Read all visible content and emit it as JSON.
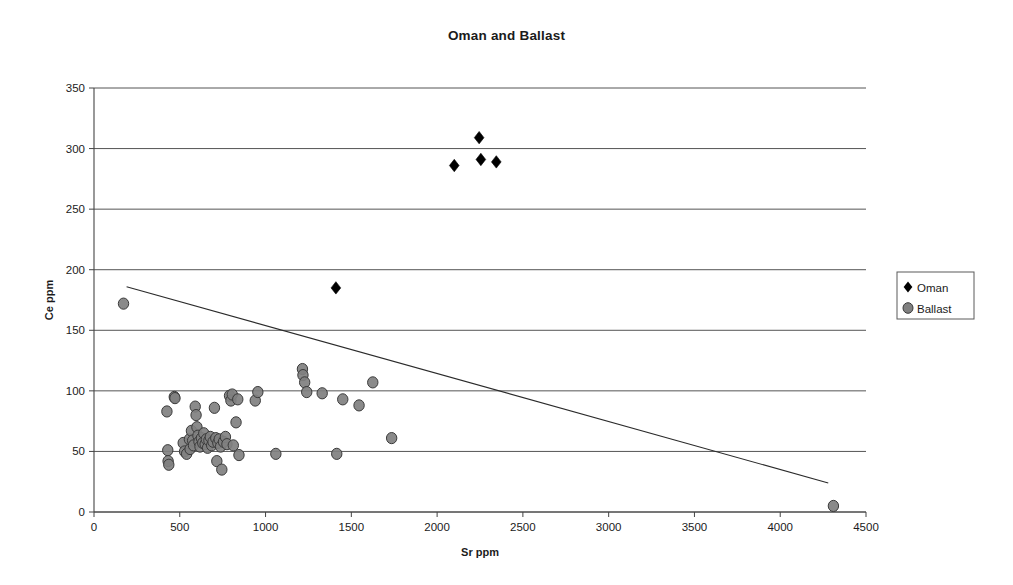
{
  "chart_data": {
    "type": "scatter",
    "title": "Oman and Ballast",
    "xlabel": "Sr ppm",
    "ylabel": "Ce ppm",
    "xlim": [
      0,
      4500
    ],
    "ylim": [
      0,
      350
    ],
    "xticks": [
      0,
      500,
      1000,
      1500,
      2000,
      2500,
      3000,
      3500,
      4000,
      4500
    ],
    "yticks": [
      0,
      50,
      100,
      150,
      200,
      250,
      300,
      350
    ],
    "grid": "horizontal",
    "legend_position": "right",
    "series": [
      {
        "name": "Oman",
        "marker": "diamond",
        "color": "#000000",
        "points": [
          [
            2100,
            286
          ],
          [
            2245,
            309
          ],
          [
            2255,
            291
          ],
          [
            2345,
            289
          ],
          [
            1410,
            185
          ]
        ]
      },
      {
        "name": "Ballast",
        "marker": "circle",
        "color": "#808080",
        "points": [
          [
            172,
            172
          ],
          [
            425,
            83
          ],
          [
            430,
            51
          ],
          [
            432,
            42
          ],
          [
            436,
            39
          ],
          [
            468,
            95
          ],
          [
            472,
            94
          ],
          [
            520,
            57
          ],
          [
            528,
            50
          ],
          [
            540,
            48
          ],
          [
            556,
            60
          ],
          [
            560,
            52
          ],
          [
            568,
            67
          ],
          [
            575,
            59
          ],
          [
            580,
            55
          ],
          [
            590,
            87
          ],
          [
            595,
            80
          ],
          [
            600,
            70
          ],
          [
            606,
            63
          ],
          [
            612,
            58
          ],
          [
            618,
            54
          ],
          [
            626,
            61
          ],
          [
            634,
            57
          ],
          [
            640,
            65
          ],
          [
            648,
            56
          ],
          [
            655,
            60
          ],
          [
            662,
            53
          ],
          [
            670,
            59
          ],
          [
            678,
            62
          ],
          [
            686,
            55
          ],
          [
            694,
            58
          ],
          [
            702,
            86
          ],
          [
            710,
            61
          ],
          [
            716,
            42
          ],
          [
            722,
            57
          ],
          [
            730,
            60
          ],
          [
            738,
            54
          ],
          [
            745,
            35
          ],
          [
            755,
            58
          ],
          [
            766,
            62
          ],
          [
            775,
            56
          ],
          [
            790,
            96
          ],
          [
            798,
            92
          ],
          [
            806,
            97
          ],
          [
            812,
            55
          ],
          [
            828,
            74
          ],
          [
            838,
            93
          ],
          [
            845,
            47
          ],
          [
            940,
            92
          ],
          [
            955,
            99
          ],
          [
            1060,
            48
          ],
          [
            1215,
            118
          ],
          [
            1218,
            113
          ],
          [
            1228,
            107
          ],
          [
            1240,
            99
          ],
          [
            1330,
            98
          ],
          [
            1415,
            48
          ],
          [
            1450,
            93
          ],
          [
            1545,
            88
          ],
          [
            1625,
            107
          ],
          [
            1735,
            61
          ],
          [
            4310,
            5
          ]
        ]
      }
    ],
    "trendline": {
      "name": "linear-trend",
      "x0": 190,
      "y0": 186,
      "x1": 4280,
      "y1": 24,
      "color": "#2b2b2b"
    }
  },
  "legend": {
    "entries": [
      {
        "label": "Oman",
        "marker": "diamond",
        "color": "#000000"
      },
      {
        "label": "Ballast",
        "marker": "circle",
        "color": "#808080"
      }
    ]
  }
}
